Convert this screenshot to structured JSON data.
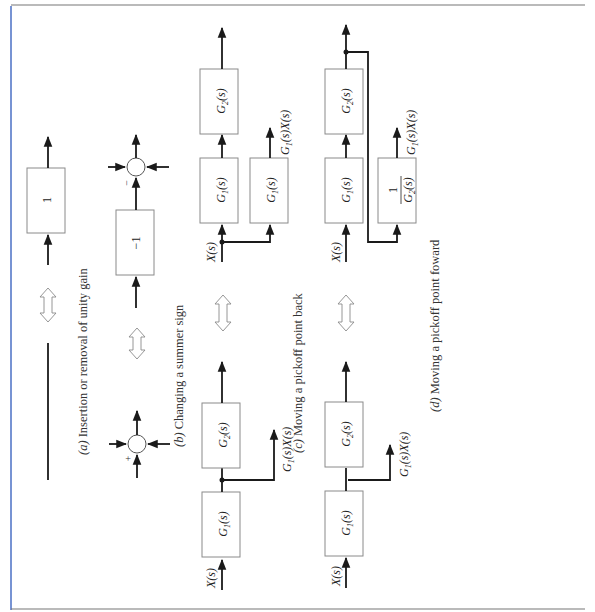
{
  "figure": {
    "orientation": "rotated 90 degrees counter-clockwise",
    "border_color": "#4a6fc4",
    "panels": [
      {
        "id": "a",
        "caption_letter": "(a)",
        "caption_text": " Insertion or removal of unity gain",
        "left_side": {
          "description": "plain line"
        },
        "right_side": {
          "block": "1"
        }
      },
      {
        "id": "b",
        "caption_letter": "(b)",
        "caption_text": " Changing a summer sign",
        "left_side": {
          "summer_sign": "+"
        },
        "right_side": {
          "block": "−1",
          "summer_sign": "−"
        }
      },
      {
        "id": "c",
        "caption_letter": "(c)",
        "caption_text": " Moving a pickoff point back",
        "left_side": {
          "input": "X(s)",
          "blocks": [
            "G1(s)",
            "G2(s)"
          ],
          "pickoff_output": "G1(s)X(s)"
        },
        "right_side": {
          "input": "X(s)",
          "blocks": [
            "G1(s)",
            "G2(s)"
          ],
          "extra_block": "G1(s)",
          "pickoff_output": "G1(s)X(s)"
        }
      },
      {
        "id": "d",
        "caption_letter": "(d)",
        "caption_text": " Moving a pickoff point foward",
        "left_side": {
          "input": "X(s)",
          "blocks": [
            "G1(s)",
            "G2(s)"
          ],
          "pickoff_output": "G1(s)X(s)"
        },
        "right_side": {
          "input": "X(s)",
          "blocks": [
            "G1(s)",
            "G2(s)"
          ],
          "extra_block_numerator": "1",
          "extra_block_denominator": "G2(s)",
          "pickoff_output": "G1(s)X(s)"
        }
      }
    ],
    "labels": {
      "G": "G",
      "sub1": "1",
      "sub2": "2",
      "paren_s": "(s)",
      "X": "X(s)",
      "G1X_G": "G",
      "G1X_rest": "(s)X(s)",
      "one": "1",
      "minus_one": "−1",
      "plus": "+",
      "minus": "−"
    }
  }
}
